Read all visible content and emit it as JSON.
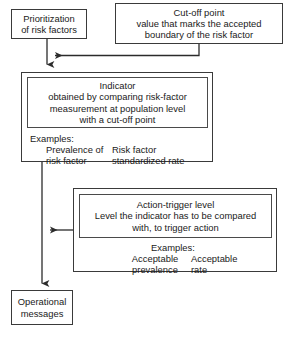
{
  "diagram": {
    "type": "flowchart",
    "colors": {
      "background": "#ffffff",
      "box_border": "#3a3a3a",
      "inner_border": "#4a4a4a",
      "text": "#1a1a1a",
      "connector": "#2b2b2b"
    }
  },
  "nodes": {
    "prioritization": {
      "line1": "Prioritization",
      "line2": "of risk factors"
    },
    "cutoff": {
      "line1": "Cut-off point",
      "line2": "value that marks the accepted",
      "line3": "boundary of the risk factor"
    },
    "indicator": {
      "line1": "Indicator",
      "line2": "obtained by comparing risk-factor",
      "line3": "measurement at population level",
      "line4": "with a cut-off point",
      "examples_label": "Examples:",
      "example_col1": "Prevalence of\nrisk factor",
      "example_col2": "Risk factor\nstandardized rate"
    },
    "action_trigger": {
      "line1": "Action-trigger level",
      "line2": "Level the indicator has to be compared",
      "line3": "with, to trigger action",
      "examples_label": "Examples:",
      "example_col1": "Acceptable\nprevalence",
      "example_col2": "Acceptable\nrate"
    },
    "operational": {
      "line1": "Operational",
      "line2": "messages"
    }
  },
  "edges": [
    {
      "name": "cutoff-to-prioritization-stem",
      "from": "cutoff",
      "to": "prioritization-stem",
      "arrow": "left"
    },
    {
      "name": "prioritization-to-indicator",
      "from": "prioritization",
      "to": "indicator",
      "arrow": "down"
    },
    {
      "name": "action-trigger-to-indicator-stem",
      "from": "action_trigger",
      "to": "indicator-stem",
      "arrow": "left"
    },
    {
      "name": "indicator-to-operational",
      "from": "indicator",
      "to": "operational",
      "arrow": "down"
    }
  ]
}
